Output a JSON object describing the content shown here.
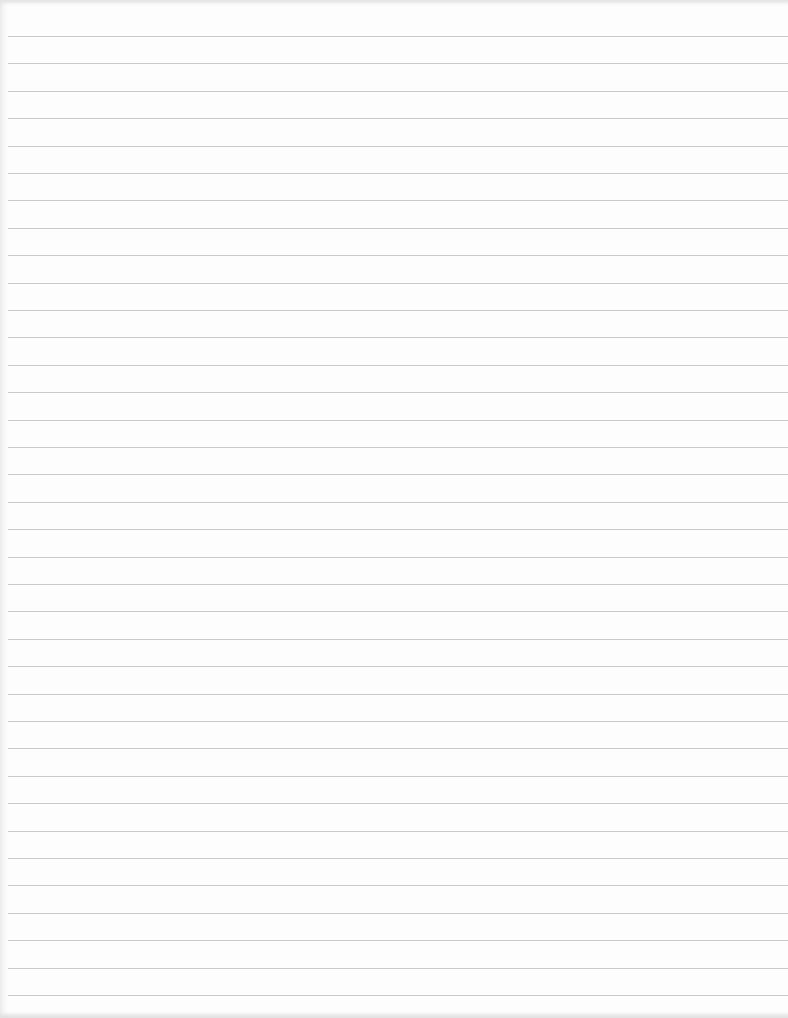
{
  "document": {
    "type": "lined-paper",
    "text": "",
    "rules": {
      "count": 36,
      "first_y": 36,
      "spacing": 27.4,
      "color": "#c9c9c9"
    },
    "background_color": "#fdfdfd"
  }
}
